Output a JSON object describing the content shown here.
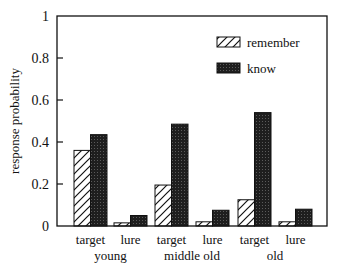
{
  "chart_data": {
    "type": "bar",
    "title": "",
    "xlabel": "",
    "ylabel": "response probability",
    "ylim": [
      0,
      1
    ],
    "yticks": [
      "0",
      "0.2",
      "0.4",
      "0.6",
      "0.8",
      "1"
    ],
    "grid": false,
    "legend_position": "upper right (inside)",
    "groups": [
      "young",
      "middle old",
      "old"
    ],
    "categories": [
      "target",
      "lure",
      "target",
      "lure",
      "target",
      "lure"
    ],
    "series": [
      {
        "name": "remember",
        "pattern": "hatched",
        "values": [
          0.36,
          0.015,
          0.195,
          0.02,
          0.125,
          0.02
        ]
      },
      {
        "name": "know",
        "pattern": "dark",
        "values": [
          0.435,
          0.05,
          0.485,
          0.075,
          0.54,
          0.08
        ]
      }
    ]
  },
  "colors": {
    "axis": "#111111",
    "know_fill": "#2a2a2a",
    "remember_fill": "#ffffff"
  }
}
